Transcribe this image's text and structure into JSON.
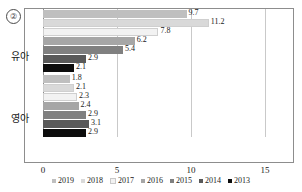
{
  "marker": {
    "label": "②"
  },
  "axis": {
    "x_ticks": [
      "0",
      "5",
      "10",
      "15"
    ],
    "x_min": 0,
    "x_max": 15
  },
  "categories": [
    "유아",
    "영아"
  ],
  "legend": {
    "items": [
      {
        "label": "2019",
        "color": "#bfbfbf"
      },
      {
        "label": "2018",
        "color": "#d9d9d9"
      },
      {
        "label": "2017",
        "color": "#f2f2f2"
      },
      {
        "label": "2016",
        "color": "#a6a6a6"
      },
      {
        "label": "2015",
        "color": "#808080"
      },
      {
        "label": "2014",
        "color": "#595959"
      },
      {
        "label": "2013",
        "color": "#0d0d0d"
      }
    ]
  },
  "chart_data": {
    "type": "bar",
    "orientation": "horizontal",
    "title": "",
    "xlabel": "",
    "ylabel": "",
    "xlim": [
      0,
      15
    ],
    "grid": true,
    "legend_position": "bottom",
    "categories": [
      "유아",
      "영아"
    ],
    "series": [
      {
        "name": "2019",
        "color": "#bfbfbf",
        "values": [
          9.7,
          1.8
        ]
      },
      {
        "name": "2018",
        "color": "#d9d9d9",
        "values": [
          11.2,
          2.1
        ]
      },
      {
        "name": "2017",
        "color": "#f2f2f2",
        "values": [
          7.8,
          2.3
        ]
      },
      {
        "name": "2016",
        "color": "#a6a6a6",
        "values": [
          6.2,
          2.4
        ]
      },
      {
        "name": "2015",
        "color": "#808080",
        "values": [
          5.4,
          2.9
        ]
      },
      {
        "name": "2014",
        "color": "#595959",
        "values": [
          2.9,
          3.1
        ]
      },
      {
        "name": "2013",
        "color": "#0d0d0d",
        "values": [
          2.1,
          2.9
        ]
      }
    ]
  }
}
